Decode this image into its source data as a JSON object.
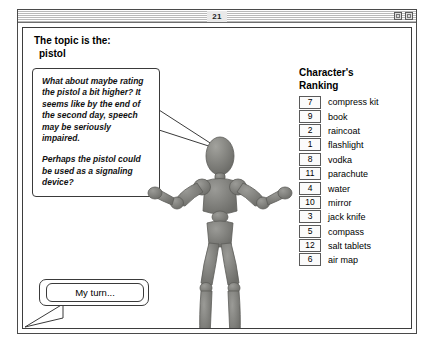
{
  "window": {
    "title": "21",
    "controls": [
      {
        "name": "zoom-box",
        "label": ""
      },
      {
        "name": "collapse-box",
        "label": ""
      }
    ]
  },
  "topic": {
    "label": "The topic is the:",
    "value": "pistol"
  },
  "speech_bubble": {
    "paragraph_1": "What about maybe rating the pistol a bit higher?  It seems like by the end of the second day, speech may be seriously impaired.",
    "paragraph_2": "Perhaps the pistol could be used as a signaling device?"
  },
  "ranking": {
    "heading_line_1": "Character's",
    "heading_line_2": "Ranking",
    "items": [
      {
        "rank": "7",
        "label": "compress kit"
      },
      {
        "rank": "9",
        "label": "book"
      },
      {
        "rank": "2",
        "label": "raincoat"
      },
      {
        "rank": "1",
        "label": "flashlight"
      },
      {
        "rank": "8",
        "label": "vodka"
      },
      {
        "rank": "11",
        "label": "parachute"
      },
      {
        "rank": "4",
        "label": "water"
      },
      {
        "rank": "10",
        "label": "mirror"
      },
      {
        "rank": "3",
        "label": "jack knife"
      },
      {
        "rank": "5",
        "label": "compass"
      },
      {
        "rank": "12",
        "label": "salt tablets"
      },
      {
        "rank": "6",
        "label": "air map"
      }
    ]
  },
  "my_turn": {
    "label": "My turn..."
  },
  "colors": {
    "window_border": "#4a4a4a",
    "content_bg": "#ffffff",
    "figure_body": "#7b7b78",
    "text": "#000000"
  }
}
